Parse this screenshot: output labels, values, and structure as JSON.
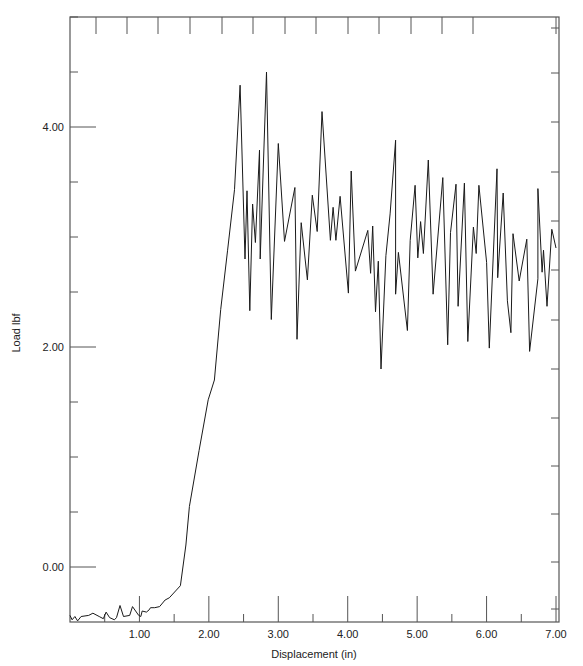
{
  "chart_data": {
    "type": "line",
    "title": "",
    "xlabel": "Displacement (in)",
    "ylabel": "Load lbf",
    "xlim": [
      0,
      7.0
    ],
    "ylim": [
      -0.5,
      5.0
    ],
    "grid": false,
    "legend": null,
    "x_ticks": [
      {
        "value": 1,
        "label": "1.00"
      },
      {
        "value": 2,
        "label": "2.00"
      },
      {
        "value": 3,
        "label": "3.00"
      },
      {
        "value": 4,
        "label": "4.00"
      },
      {
        "value": 5,
        "label": "5.00"
      },
      {
        "value": 6,
        "label": "6.00"
      },
      {
        "value": 7,
        "label": "7.00"
      }
    ],
    "y_ticks": [
      {
        "value": 0,
        "label": "0.00"
      },
      {
        "value": 2,
        "label": "2.00"
      },
      {
        "value": 4,
        "label": "4.00"
      }
    ],
    "series": [
      {
        "name": "Load",
        "color": "#1a1a1a",
        "x": [
          0.0,
          0.03,
          0.07,
          0.11,
          0.16,
          0.27,
          0.33,
          0.42,
          0.48,
          0.52,
          0.57,
          0.64,
          0.67,
          0.72,
          0.77,
          0.86,
          0.9,
          0.99,
          1.02,
          1.04,
          1.1,
          1.14,
          1.16,
          1.22,
          1.29,
          1.37,
          1.43,
          1.59,
          1.67,
          1.72,
          1.86,
          1.99,
          2.08,
          2.17,
          2.27,
          2.37,
          2.45,
          2.52,
          2.55,
          2.59,
          2.63,
          2.67,
          2.73,
          2.74,
          2.83,
          2.9,
          3.0,
          3.09,
          3.24,
          3.27,
          3.33,
          3.42,
          3.49,
          3.56,
          3.63,
          3.75,
          3.79,
          3.83,
          3.89,
          4.01,
          4.05,
          4.11,
          4.29,
          4.33,
          4.36,
          4.4,
          4.44,
          4.48,
          4.55,
          4.61,
          4.69,
          4.69,
          4.73,
          4.86,
          4.9,
          4.97,
          5.01,
          5.05,
          5.09,
          5.16,
          5.23,
          5.37,
          5.44,
          5.48,
          5.56,
          5.59,
          5.68,
          5.73,
          5.81,
          5.85,
          5.89,
          6.0,
          6.04,
          6.15,
          6.16,
          6.24,
          6.3,
          6.35,
          6.38,
          6.47,
          6.58,
          6.62,
          6.74,
          6.74,
          6.8,
          6.82,
          6.87,
          6.94,
          7.0
        ],
        "y": [
          -0.44,
          -0.48,
          -0.45,
          -0.49,
          -0.45,
          -0.44,
          -0.42,
          -0.45,
          -0.47,
          -0.41,
          -0.46,
          -0.48,
          -0.46,
          -0.35,
          -0.45,
          -0.44,
          -0.36,
          -0.44,
          -0.45,
          -0.4,
          -0.41,
          -0.39,
          -0.37,
          -0.37,
          -0.36,
          -0.3,
          -0.28,
          -0.17,
          0.2,
          0.55,
          1.06,
          1.52,
          1.7,
          2.34,
          2.88,
          3.43,
          4.38,
          2.8,
          3.42,
          2.33,
          3.3,
          2.95,
          3.79,
          2.8,
          4.5,
          2.25,
          3.85,
          2.96,
          3.45,
          2.07,
          3.13,
          2.61,
          3.38,
          3.05,
          4.14,
          2.97,
          3.27,
          2.97,
          3.37,
          2.49,
          3.6,
          2.69,
          3.06,
          2.67,
          3.1,
          2.32,
          2.78,
          1.8,
          2.83,
          3.21,
          3.88,
          2.48,
          2.86,
          2.15,
          2.97,
          3.47,
          2.81,
          3.14,
          2.85,
          3.7,
          2.48,
          3.54,
          2.02,
          3.04,
          3.48,
          2.37,
          3.49,
          2.05,
          3.09,
          2.85,
          3.47,
          2.77,
          1.99,
          3.62,
          2.63,
          3.4,
          2.42,
          2.13,
          3.03,
          2.6,
          2.98,
          1.96,
          2.62,
          3.44,
          2.68,
          2.88,
          2.37,
          3.07,
          2.9
        ]
      }
    ]
  },
  "plot": {
    "frame": {
      "left": 70,
      "top": 17,
      "right": 559,
      "bottom": 622
    },
    "y_minor_step": 0.5,
    "x_minor_step": 0.5,
    "top_ticks_px": [
      96,
      127,
      158,
      190,
      222,
      253,
      285,
      316,
      348,
      379,
      411,
      442,
      473,
      556
    ],
    "right_ticks_px": [
      28,
      73,
      122,
      172,
      221,
      270,
      320,
      369,
      418,
      466,
      514,
      562,
      609
    ],
    "axis_color": "#555555",
    "line_color": "#1a1a1a"
  }
}
